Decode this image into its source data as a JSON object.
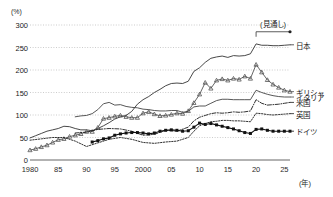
{
  "chart_data": {
    "type": "line",
    "title": "",
    "xlabel": "(年)",
    "ylabel": "(%)",
    "ylim": [
      0,
      300
    ],
    "xlim": [
      1980,
      2026
    ],
    "grid": true,
    "legend_position": "right",
    "yticks": [
      "0",
      "50",
      "100",
      "150",
      "200",
      "250",
      "300"
    ],
    "ytick_values": [
      0,
      50,
      100,
      150,
      200,
      250,
      300
    ],
    "xticks": [
      "1980",
      "85",
      "90",
      "95",
      "2000",
      "05",
      "10",
      "15",
      "20",
      "25"
    ],
    "xtick_values": [
      1980,
      1985,
      1990,
      1995,
      2000,
      2005,
      2010,
      2015,
      2020,
      2025
    ],
    "annotations": [
      {
        "text": "(見通し)",
        "kind": "forecast-bracket",
        "x_start": 2020,
        "x_end": 2026,
        "y": 285
      }
    ],
    "series": [
      {
        "name": "日本",
        "style": "solid",
        "marker": "none",
        "color": "#333333",
        "x": [
          1980,
          1981,
          1982,
          1983,
          1984,
          1985,
          1986,
          1987,
          1988,
          1989,
          1990,
          1991,
          1992,
          1993,
          1994,
          1995,
          1996,
          1997,
          1998,
          1999,
          2000,
          2001,
          2002,
          2003,
          2004,
          2005,
          2006,
          2007,
          2008,
          2009,
          2010,
          2011,
          2012,
          2013,
          2014,
          2015,
          2016,
          2017,
          2018,
          2019,
          2020,
          2021,
          2022,
          2023,
          2024,
          2025,
          2026
        ],
        "y": [
          49,
          54,
          59,
          64,
          67,
          70,
          75,
          74,
          70,
          67,
          67,
          65,
          70,
          76,
          83,
          91,
          96,
          99,
          108,
          124,
          134,
          141,
          150,
          157,
          165,
          170,
          171,
          170,
          175,
          197,
          205,
          217,
          226,
          229,
          231,
          228,
          232,
          231,
          232,
          236,
          258,
          255,
          255,
          254,
          254,
          255,
          256
        ]
      },
      {
        "name": "ギリシャ",
        "style": "solid",
        "marker": "triangle",
        "color": "#555555",
        "x": [
          1980,
          1981,
          1982,
          1983,
          1984,
          1985,
          1986,
          1987,
          1988,
          1989,
          1990,
          1991,
          1992,
          1993,
          1994,
          1995,
          1996,
          1997,
          1998,
          1999,
          2000,
          2001,
          2002,
          2003,
          2004,
          2005,
          2006,
          2007,
          2008,
          2009,
          2010,
          2011,
          2012,
          2013,
          2014,
          2015,
          2016,
          2017,
          2018,
          2019,
          2020,
          2021,
          2022,
          2023,
          2024,
          2025,
          2026
        ],
        "y": [
          22,
          25,
          29,
          33,
          39,
          45,
          47,
          52,
          55,
          58,
          63,
          63,
          72,
          92,
          94,
          97,
          99,
          96,
          94,
          94,
          104,
          107,
          102,
          98,
          99,
          101,
          104,
          103,
          109,
          127,
          146,
          172,
          159,
          177,
          180,
          177,
          181,
          179,
          186,
          181,
          212,
          195,
          178,
          168,
          161,
          155,
          152
        ]
      },
      {
        "name": "イタリア",
        "style": "solid",
        "marker": "none",
        "color": "#444444",
        "x": [
          1988,
          1989,
          1990,
          1991,
          1992,
          1993,
          1994,
          1995,
          1996,
          1997,
          1998,
          1999,
          2000,
          2001,
          2002,
          2003,
          2004,
          2005,
          2006,
          2007,
          2008,
          2009,
          2010,
          2011,
          2012,
          2013,
          2014,
          2015,
          2016,
          2017,
          2018,
          2019,
          2020,
          2021,
          2022,
          2023,
          2024,
          2025,
          2026
        ],
        "y": [
          96,
          98,
          99,
          103,
          112,
          125,
          128,
          122,
          123,
          119,
          117,
          116,
          113,
          112,
          110,
          109,
          109,
          110,
          110,
          106,
          108,
          118,
          120,
          120,
          126,
          132,
          135,
          135,
          134,
          134,
          134,
          134,
          155,
          150,
          146,
          143,
          141,
          140,
          140
        ]
      },
      {
        "name": "米国",
        "style": "dash-dot",
        "marker": "none",
        "color": "#1a1a1a",
        "x": [
          1988,
          1990,
          1992,
          1994,
          1996,
          1998,
          2000,
          2002,
          2004,
          2006,
          2008,
          2009,
          2010,
          2011,
          2012,
          2013,
          2014,
          2015,
          2016,
          2017,
          2018,
          2019,
          2020,
          2021,
          2022,
          2023,
          2024,
          2025,
          2026
        ],
        "y": [
          60,
          62,
          68,
          70,
          69,
          64,
          55,
          57,
          66,
          64,
          73,
          87,
          95,
          99,
          103,
          105,
          104,
          105,
          107,
          106,
          107,
          109,
          134,
          126,
          122,
          123,
          124,
          126,
          128
        ]
      },
      {
        "name": "英国",
        "style": "dotted",
        "marker": "none",
        "color": "#1a1a1a",
        "x": [
          1980,
          1982,
          1984,
          1986,
          1988,
          1990,
          1992,
          1994,
          1996,
          1998,
          2000,
          2002,
          2004,
          2006,
          2008,
          2009,
          2010,
          2011,
          2012,
          2013,
          2014,
          2015,
          2016,
          2017,
          2018,
          2019,
          2020,
          2021,
          2022,
          2023,
          2024,
          2025,
          2026
        ],
        "y": [
          44,
          47,
          50,
          50,
          42,
          30,
          38,
          46,
          50,
          46,
          39,
          37,
          40,
          42,
          50,
          64,
          76,
          81,
          85,
          86,
          88,
          88,
          87,
          87,
          86,
          85,
          104,
          103,
          101,
          100,
          101,
          102,
          103
        ]
      },
      {
        "name": "ドイツ",
        "style": "solid",
        "marker": "square",
        "color": "#111111",
        "x": [
          1991,
          1992,
          1993,
          1994,
          1995,
          1996,
          1997,
          1998,
          1999,
          2000,
          2001,
          2002,
          2003,
          2004,
          2005,
          2006,
          2007,
          2008,
          2009,
          2010,
          2011,
          2012,
          2013,
          2014,
          2015,
          2016,
          2017,
          2018,
          2019,
          2020,
          2021,
          2022,
          2023,
          2024,
          2025,
          2026
        ],
        "y": [
          40,
          43,
          47,
          49,
          55,
          58,
          60,
          61,
          61,
          60,
          58,
          60,
          64,
          66,
          67,
          66,
          64,
          65,
          73,
          82,
          79,
          81,
          78,
          75,
          72,
          69,
          65,
          61,
          59,
          68,
          69,
          66,
          64,
          64,
          64,
          64
        ]
      }
    ]
  },
  "legend": {
    "items": [
      {
        "label": "日本",
        "value_at_end": 256
      },
      {
        "label": "ギリシャ",
        "value_at_end": 152
      },
      {
        "label": "イタリア",
        "value_at_end": 140
      },
      {
        "label": "米国",
        "value_at_end": 128
      },
      {
        "label": "英国",
        "value_at_end": 103
      },
      {
        "label": "ドイツ",
        "value_at_end": 64
      }
    ]
  }
}
